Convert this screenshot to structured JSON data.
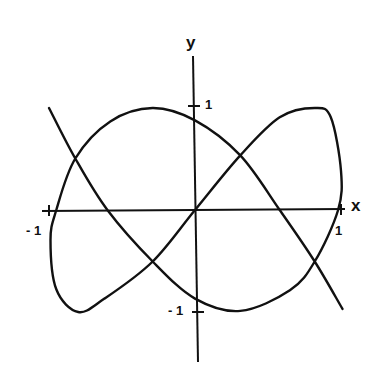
{
  "chart_data": {
    "type": "line",
    "title": "",
    "xlabel": "x",
    "ylabel": "y",
    "xlim": [
      -1,
      1
    ],
    "ylim": [
      -1,
      1
    ],
    "grid": false,
    "legend": null,
    "x_ticks": [
      {
        "value": -1,
        "label": "- 1"
      },
      {
        "value": 1,
        "label": "1"
      }
    ],
    "y_ticks": [
      {
        "value": 1,
        "label": "1"
      },
      {
        "value": -1,
        "label": "- 1"
      }
    ],
    "series": [
      {
        "name": "parametric-curve",
        "description": "Single continuous open curve forming two loops, passing through the origin; ends extend diagonally from upper-left to lower-right",
        "points": [
          [
            -1.0,
            0.99
          ],
          [
            -0.82,
            0.5
          ],
          [
            -0.6,
            0.0
          ],
          [
            -0.29,
            -0.5
          ],
          [
            0.0,
            -0.86
          ],
          [
            0.31,
            -0.98
          ],
          [
            0.65,
            -0.78
          ],
          [
            0.82,
            -0.5
          ],
          [
            0.98,
            0.0
          ],
          [
            1.0,
            0.38
          ],
          [
            0.93,
            0.9
          ],
          [
            0.82,
            0.99
          ],
          [
            0.58,
            0.9
          ],
          [
            0.31,
            0.53
          ],
          [
            0.0,
            0.0
          ],
          [
            -0.29,
            -0.5
          ],
          [
            -0.62,
            -0.86
          ],
          [
            -0.8,
            -0.99
          ],
          [
            -0.95,
            -0.77
          ],
          [
            -0.99,
            -0.29
          ],
          [
            -0.95,
            0.0
          ],
          [
            -0.82,
            0.5
          ],
          [
            -0.58,
            0.86
          ],
          [
            -0.29,
            0.99
          ],
          [
            0.0,
            0.87
          ],
          [
            0.31,
            0.53
          ],
          [
            0.58,
            0.0
          ],
          [
            0.82,
            -0.5
          ],
          [
            1.01,
            -0.96
          ]
        ]
      }
    ]
  },
  "labels": {
    "x_axis": "x",
    "y_axis": "y",
    "x_tick_neg": "- 1",
    "x_tick_pos": "1",
    "y_tick_pos": "1",
    "y_tick_neg": "- 1"
  },
  "style": {
    "stroke": "#111111",
    "background": "#ffffff"
  }
}
